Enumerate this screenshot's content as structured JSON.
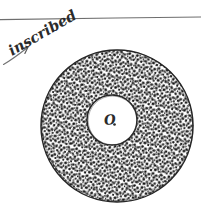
{
  "figure": {
    "kind": "hand-drawn-geometry-sketch",
    "background_color": "#ffffff",
    "ink_color": "#262626",
    "pencil_color": "#5a5a5a",
    "shading_color": "#1a1a1a",
    "annotation": {
      "text": "inscribed",
      "rotation_degrees": -28,
      "arrow": "arrow-pointing-up-right"
    },
    "rule": {
      "label": "horizontal ruled line"
    },
    "annulus": {
      "center_label": "O",
      "outer_circle": {
        "cx": 117,
        "cy": 126,
        "r": 76
      },
      "inner_circle": {
        "cx": 112,
        "cy": 120,
        "r": 25
      },
      "shading": "stipple-dots"
    }
  }
}
